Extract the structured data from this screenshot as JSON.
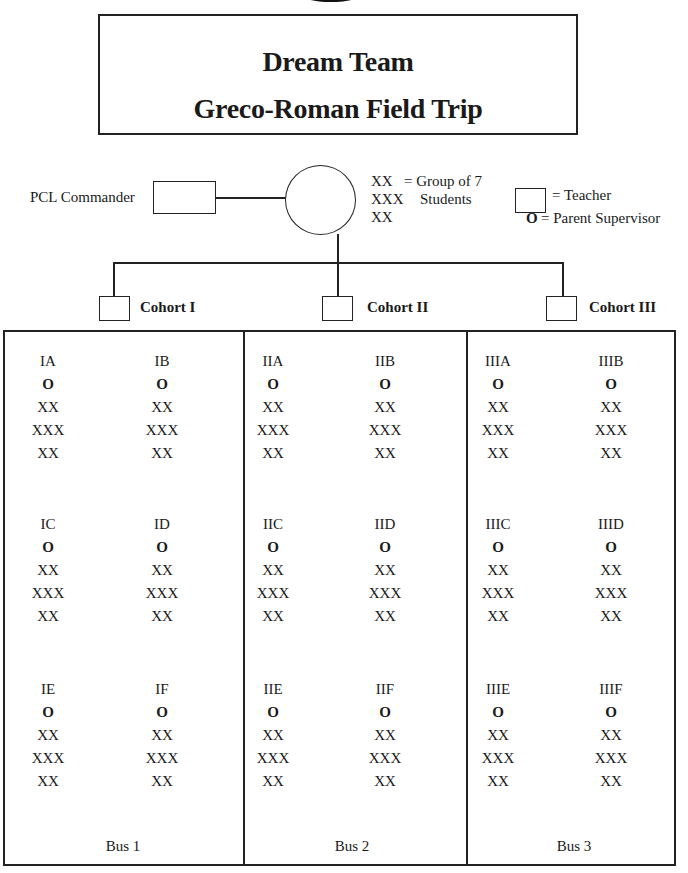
{
  "title": {
    "line1": "Dream Team",
    "line2": "Greco-Roman Field Trip"
  },
  "org": {
    "commander_label": "PCL Commander",
    "legend": {
      "xx_line1": "XX",
      "xx_eq": "= Group of 7",
      "xxx_line": "XXX",
      "students": "Students",
      "xx_line3": "XX",
      "teacher_eq": "= Teacher",
      "parent_symbol": "O",
      "parent_eq": "= Parent Supervisor"
    },
    "cohorts": [
      "Cohort I",
      "Cohort II",
      "Cohort III"
    ]
  },
  "buses": [
    {
      "label": "Bus 1",
      "groups": [
        {
          "name": "IA",
          "supervisor": "O",
          "rows": [
            "XX",
            "XXX",
            "XX"
          ]
        },
        {
          "name": "IB",
          "supervisor": "O",
          "rows": [
            "XX",
            "XXX",
            "XX"
          ]
        },
        {
          "name": "IC",
          "supervisor": "O",
          "rows": [
            "XX",
            "XXX",
            "XX"
          ]
        },
        {
          "name": "ID",
          "supervisor": "O",
          "rows": [
            "XX",
            "XXX",
            "XX"
          ]
        },
        {
          "name": "IE",
          "supervisor": "O",
          "rows": [
            "XX",
            "XXX",
            "XX"
          ]
        },
        {
          "name": "IF",
          "supervisor": "O",
          "rows": [
            "XX",
            "XXX",
            "XX"
          ]
        }
      ]
    },
    {
      "label": "Bus 2",
      "groups": [
        {
          "name": "IIA",
          "supervisor": "O",
          "rows": [
            "XX",
            "XXX",
            "XX"
          ]
        },
        {
          "name": "IIB",
          "supervisor": "O",
          "rows": [
            "XX",
            "XXX",
            "XX"
          ]
        },
        {
          "name": "IIC",
          "supervisor": "O",
          "rows": [
            "XX",
            "XXX",
            "XX"
          ]
        },
        {
          "name": "IID",
          "supervisor": "O",
          "rows": [
            "XX",
            "XXX",
            "XX"
          ]
        },
        {
          "name": "IIE",
          "supervisor": "O",
          "rows": [
            "XX",
            "XXX",
            "XX"
          ]
        },
        {
          "name": "IIF",
          "supervisor": "O",
          "rows": [
            "XX",
            "XXX",
            "XX"
          ]
        }
      ]
    },
    {
      "label": "Bus 3",
      "groups": [
        {
          "name": "IIIA",
          "supervisor": "O",
          "rows": [
            "XX",
            "XXX",
            "XX"
          ]
        },
        {
          "name": "IIIB",
          "supervisor": "O",
          "rows": [
            "XX",
            "XXX",
            "XX"
          ]
        },
        {
          "name": "IIIC",
          "supervisor": "O",
          "rows": [
            "XX",
            "XXX",
            "XX"
          ]
        },
        {
          "name": "IIID",
          "supervisor": "O",
          "rows": [
            "XX",
            "XXX",
            "XX"
          ]
        },
        {
          "name": "IIIE",
          "supervisor": "O",
          "rows": [
            "XX",
            "XXX",
            "XX"
          ]
        },
        {
          "name": "IIIF",
          "supervisor": "O",
          "rows": [
            "XX",
            "XXX",
            "XX"
          ]
        }
      ]
    }
  ]
}
